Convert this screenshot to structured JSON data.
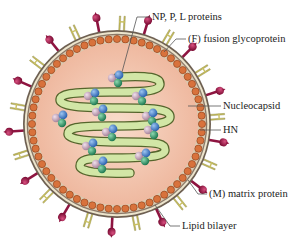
{
  "diagram": {
    "type": "virus-structure",
    "labels": [
      {
        "id": "np-p-l",
        "text": "NP, P, L proteins",
        "x": 152,
        "y": 11
      },
      {
        "id": "f-protein",
        "text": "(F) fusion glycoprotein",
        "x": 188,
        "y": 33
      },
      {
        "id": "nucleocapsid",
        "text": "Nucleocapsid",
        "x": 223,
        "y": 100
      },
      {
        "id": "hn",
        "text": "HN",
        "x": 223,
        "y": 124
      },
      {
        "id": "m-protein",
        "text": "(M) matrix protein",
        "x": 209,
        "y": 188
      },
      {
        "id": "lipid-bilayer",
        "text": "Lipid bilayer",
        "x": 182,
        "y": 220
      }
    ],
    "colors": {
      "interior": "#f2c4ae",
      "interior_center": "#f7d6c4",
      "matrix_beads": "#d9703a",
      "lipid_outer": "#7a6a5a",
      "lipid_inner": "#e8e0c8",
      "nucleocapsid_fill": "#cfe3a0",
      "nucleocapsid_stroke": "#5a6a30",
      "f_protein": "#e3dc7a",
      "hn_protein": "#a0194a",
      "sphere_blue": "#3a78c8",
      "sphere_green": "#2f9a6a",
      "sphere_pink": "#c9a8c0",
      "leader_line": "#555555"
    }
  }
}
